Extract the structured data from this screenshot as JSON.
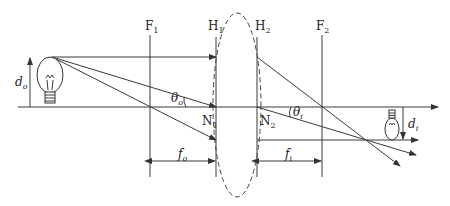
{
  "diagram": {
    "type": "thick-lens-imaging",
    "labels": {
      "focal_point_1": "F",
      "focal_point_1_sub": "1",
      "focal_point_2": "F",
      "focal_point_2_sub": "2",
      "principal_plane_1": "H",
      "principal_plane_1_sub": "1",
      "principal_plane_2": "H",
      "principal_plane_2_sub": "2",
      "nodal_point_1": "N",
      "nodal_point_1_sub": "1",
      "nodal_point_2": "N",
      "nodal_point_2_sub": "2",
      "object_distance_height": "d",
      "object_distance_height_sub": "o",
      "image_height": "d",
      "image_height_sub": "i",
      "object_angle": "θ",
      "object_angle_sub": "o",
      "image_angle": "θ",
      "image_angle_sub": "i",
      "object_focal_length": "f",
      "object_focal_length_sub": "o",
      "image_focal_length": "f",
      "image_focal_length_sub": "i"
    },
    "elements": {
      "object": "light-bulb (upright)",
      "image": "light-bulb (inverted, smaller)",
      "lens": "dashed thick lens outline"
    }
  }
}
